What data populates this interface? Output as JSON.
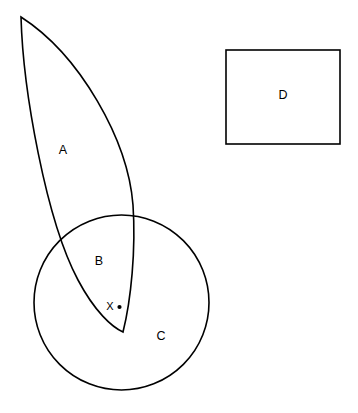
{
  "figure": {
    "background_color": "#ffffff",
    "stroke_color": "#000000",
    "width": 358,
    "height": 413
  },
  "shapes": {
    "lens": {
      "name": "A",
      "description": "crescent / lens shape",
      "apex": [
        21,
        17
      ],
      "tip": [
        123,
        332
      ]
    },
    "circle": {
      "name": "C",
      "description": "circle",
      "center": [
        121.5,
        302
      ],
      "radius": 82,
      "left": 34,
      "right": 209,
      "top": 221,
      "bottom": 384
    },
    "rectangle": {
      "name": "D",
      "description": "rectangle",
      "x": 226,
      "y": 50,
      "width": 114,
      "height": 94
    },
    "overlap": {
      "name": "B",
      "description": "intersection of lens and circle"
    }
  },
  "labels": {
    "a": "A",
    "b": "B",
    "c": "C",
    "d": "D",
    "x": "X"
  },
  "point": {
    "label": "X",
    "marker": "dot",
    "position": [
      119,
      307
    ]
  }
}
